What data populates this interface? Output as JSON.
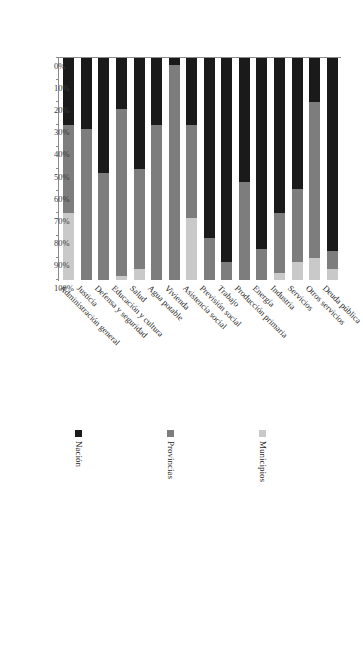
{
  "chart_data": {
    "type": "bar",
    "orientation": "horizontal-stacked",
    "title": "",
    "subtitle": "",
    "xlabel": "",
    "ylabel": "",
    "grid": false,
    "stacked": true,
    "percent_stacked": true,
    "axis_direction": "reversed (100% at left, 0% at right)",
    "xlim": [
      0,
      100
    ],
    "tick_labels": [
      "100%",
      "90%",
      "80%",
      "70%",
      "60%",
      "50%",
      "40%",
      "30%",
      "20%",
      "10%",
      "0%"
    ],
    "tick_values": [
      100,
      90,
      80,
      70,
      60,
      50,
      40,
      30,
      20,
      10,
      0
    ],
    "legend_position": "right",
    "categories": [
      "Deuda pública",
      "Otros servicios",
      "Servicios",
      "Industria",
      "Energía",
      "Producción primaria",
      "Trabajo",
      "Previsión social",
      "Asistencia social",
      "Vivienda",
      "Agua potable",
      "Salud",
      "Educación y cultura",
      "Defensa y seguridad",
      "Justicia",
      "Administración general"
    ],
    "series": [
      {
        "name": "Nación",
        "color": "#1a1a1a",
        "values": [
          87,
          20,
          59,
          70,
          86,
          56,
          92,
          81,
          30,
          3,
          30,
          50,
          23,
          52,
          32,
          30
        ]
      },
      {
        "name": "Provincias",
        "color": "#7d7d7d",
        "values": [
          8,
          70,
          33,
          27,
          14,
          44,
          8,
          19,
          42,
          97,
          70,
          45,
          75,
          48,
          68,
          40
        ]
      },
      {
        "name": "Municipios",
        "color": "#c9c9c9",
        "values": [
          5,
          10,
          8,
          3,
          0,
          0,
          0,
          0,
          28,
          0,
          0,
          5,
          2,
          0,
          0,
          30
        ]
      }
    ]
  },
  "legend": {
    "items": [
      {
        "label": "Municipios",
        "color": "#c9c9c9"
      },
      {
        "label": "Provincias",
        "color": "#7d7d7d"
      },
      {
        "label": "Nación",
        "color": "#1a1a1a"
      }
    ]
  }
}
